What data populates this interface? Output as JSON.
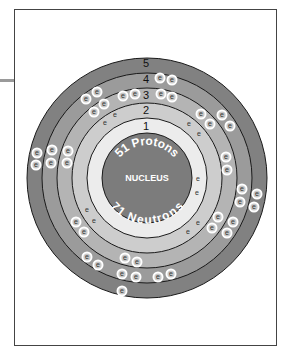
{
  "diagram": {
    "type": "bohr-atom-model",
    "nucleus": {
      "label": "NUCLEUS",
      "protons_label": "51 Protons",
      "neutrons_label": "71 Neutrons",
      "color": "#7c7c7c"
    },
    "electron_symbol": "e",
    "shells": [
      {
        "number": "1",
        "color": "#ececec",
        "electron_count": 2
      },
      {
        "number": "2",
        "color": "#cdcdcd",
        "electron_count": 8
      },
      {
        "number": "3",
        "color": "#b4b4b4",
        "electron_count": 18
      },
      {
        "number": "4",
        "color": "#9b9b9b",
        "electron_count": 18
      },
      {
        "number": "5",
        "color": "#818181",
        "electron_count": 5
      }
    ],
    "electrons": [
      {
        "shell": 1,
        "x": 198,
        "y": 179
      },
      {
        "shell": 1,
        "x": 197,
        "y": 193
      },
      {
        "shell": 2,
        "x": 105,
        "y": 123
      },
      {
        "shell": 2,
        "x": 115,
        "y": 115
      },
      {
        "shell": 2,
        "x": 189,
        "y": 124
      },
      {
        "shell": 2,
        "x": 199,
        "y": 134
      },
      {
        "shell": 2,
        "x": 198,
        "y": 223
      },
      {
        "shell": 2,
        "x": 188,
        "y": 232
      },
      {
        "shell": 2,
        "x": 87,
        "y": 210
      },
      {
        "shell": 2,
        "x": 94,
        "y": 221
      },
      {
        "shell": 3,
        "x": 123,
        "y": 96
      },
      {
        "shell": 3,
        "x": 135,
        "y": 94
      },
      {
        "shell": 3,
        "x": 161,
        "y": 94
      },
      {
        "shell": 3,
        "x": 172,
        "y": 97
      },
      {
        "shell": 3,
        "x": 94,
        "y": 112
      },
      {
        "shell": 3,
        "x": 104,
        "y": 104
      },
      {
        "shell": 3,
        "x": 201,
        "y": 114
      },
      {
        "shell": 3,
        "x": 210,
        "y": 124
      },
      {
        "shell": 3,
        "x": 226,
        "y": 157
      },
      {
        "shell": 3,
        "x": 227,
        "y": 170
      },
      {
        "shell": 3,
        "x": 218,
        "y": 217
      },
      {
        "shell": 3,
        "x": 212,
        "y": 228
      },
      {
        "shell": 3,
        "x": 125,
        "y": 258
      },
      {
        "shell": 3,
        "x": 137,
        "y": 262
      },
      {
        "shell": 3,
        "x": 76,
        "y": 222
      },
      {
        "shell": 3,
        "x": 84,
        "y": 232
      },
      {
        "shell": 3,
        "x": 68,
        "y": 151
      },
      {
        "shell": 3,
        "x": 67,
        "y": 163
      },
      {
        "shell": 4,
        "x": 160,
        "y": 78
      },
      {
        "shell": 4,
        "x": 172,
        "y": 80
      },
      {
        "shell": 4,
        "x": 86,
        "y": 99
      },
      {
        "shell": 4,
        "x": 97,
        "y": 92
      },
      {
        "shell": 4,
        "x": 222,
        "y": 115
      },
      {
        "shell": 4,
        "x": 230,
        "y": 126
      },
      {
        "shell": 4,
        "x": 242,
        "y": 189
      },
      {
        "shell": 4,
        "x": 240,
        "y": 202
      },
      {
        "shell": 4,
        "x": 233,
        "y": 222
      },
      {
        "shell": 4,
        "x": 227,
        "y": 233
      },
      {
        "shell": 4,
        "x": 87,
        "y": 257
      },
      {
        "shell": 4,
        "x": 98,
        "y": 265
      },
      {
        "shell": 4,
        "x": 122,
        "y": 274
      },
      {
        "shell": 4,
        "x": 136,
        "y": 277
      },
      {
        "shell": 4,
        "x": 158,
        "y": 277
      },
      {
        "shell": 4,
        "x": 171,
        "y": 274
      },
      {
        "shell": 4,
        "x": 52,
        "y": 150
      },
      {
        "shell": 4,
        "x": 51,
        "y": 163
      },
      {
        "shell": 5,
        "x": 37,
        "y": 153
      },
      {
        "shell": 5,
        "x": 36,
        "y": 165
      },
      {
        "shell": 5,
        "x": 257,
        "y": 194
      },
      {
        "shell": 5,
        "x": 254,
        "y": 207
      },
      {
        "shell": 5,
        "x": 122,
        "y": 291
      }
    ],
    "colors": {
      "outline": "#1a1a1a",
      "frame_border": "#444444",
      "electron_fill": "#ffffff",
      "electron_core": "#c8c8c8"
    }
  }
}
